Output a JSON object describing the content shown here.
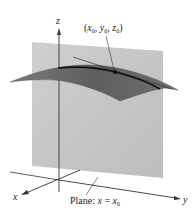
{
  "figure": {
    "axes": {
      "z_label": "z",
      "x_label": "x",
      "y_label": "y"
    },
    "point_label": {
      "open": "(",
      "x": "x",
      "x_sub": "0",
      "sep1": ", ",
      "y": "y",
      "y_sub": "0",
      "sep2": ", ",
      "z": "z",
      "z_sub": "0",
      "close": ")"
    },
    "plane_label": {
      "prefix": "Plane: ",
      "var": "x",
      "eq": " = ",
      "rhs": "x",
      "rhs_sub": "0"
    },
    "colors": {
      "plane": "#c9c9c9",
      "surface": "#6e6e6e",
      "surface_dark": "#555555",
      "curve": "#111111",
      "axis": "#333333"
    }
  }
}
